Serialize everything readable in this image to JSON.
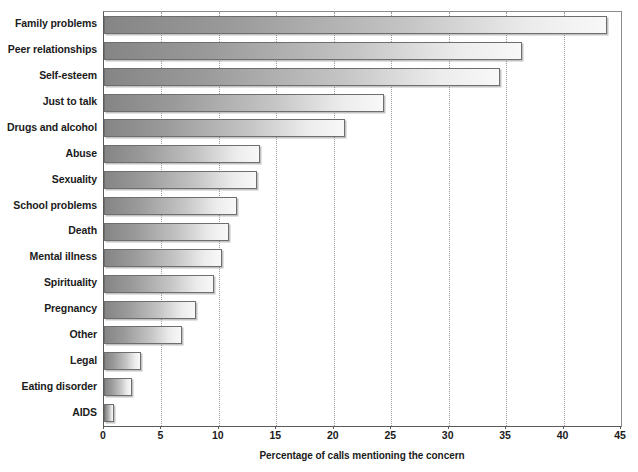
{
  "chart_data": {
    "type": "bar",
    "orientation": "horizontal",
    "title": "",
    "xlabel": "Percentage of calls mentioning the concern",
    "ylabel": "",
    "xlim": [
      0,
      45
    ],
    "xticks": [
      0,
      5,
      10,
      15,
      20,
      25,
      30,
      35,
      40,
      45
    ],
    "grid": "vertical-dotted",
    "legend": "none",
    "categories": [
      "Family problems",
      "Peer relationships",
      "Self-esteem",
      "Just to talk",
      "Drugs and alcohol",
      "Abuse",
      "Sexuality",
      "School problems",
      "Death",
      "Mental illness",
      "Spirituality",
      "Pregnancy",
      "Other",
      "Legal",
      "Eating disorder",
      "AIDS"
    ],
    "values": [
      43.8,
      36.4,
      34.5,
      24.4,
      21.0,
      13.6,
      13.3,
      11.6,
      10.9,
      10.3,
      9.6,
      8.0,
      6.8,
      3.2,
      2.4,
      0.9
    ],
    "bar_fill": "linear-gradient gray to white",
    "bar_edge_color": "#6e6e6e",
    "axis_color": "#5a5a5a",
    "gridline_color": "#9a9a9a",
    "background": "#ffffff"
  }
}
